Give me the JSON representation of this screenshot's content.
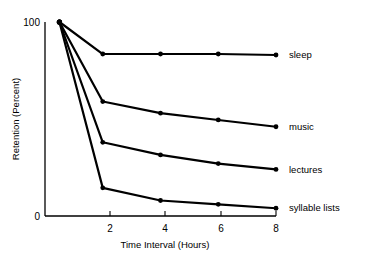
{
  "chart_data": {
    "type": "line",
    "title": "",
    "subtitle": "",
    "xlabel": "Time Interval (Hours)",
    "ylabel": "Retention (Percent)",
    "x": [
      0.5,
      2,
      4,
      6,
      8
    ],
    "xlim": [
      0,
      8
    ],
    "ylim": [
      0,
      100
    ],
    "xticks": [
      2,
      4,
      6,
      8
    ],
    "xtick_labels": [
      "2",
      "4",
      "6",
      "8"
    ],
    "yticks": [
      0,
      100
    ],
    "ytick_labels": [
      "0",
      "100"
    ],
    "grid": false,
    "legend_position": "right-inline-labels",
    "marker": "filled-circle",
    "line_color": "#000000",
    "series": [
      {
        "name": "sleep",
        "label": "sleep",
        "values": [
          100,
          83.5,
          83.5,
          83.5,
          83
        ]
      },
      {
        "name": "music",
        "label": "music",
        "values": [
          100,
          59,
          53,
          49.5,
          46
        ]
      },
      {
        "name": "lectures",
        "label": "lectures",
        "values": [
          100,
          38,
          31.5,
          27,
          24
        ]
      },
      {
        "name": "syllable lists",
        "label": "syllable lists",
        "values": [
          100,
          14.5,
          8,
          6,
          4
        ]
      }
    ]
  },
  "axes": {
    "y_top_label": "100",
    "y_bottom_label": "0",
    "x_labels": [
      "2",
      "4",
      "6",
      "8"
    ],
    "x_title": "Time Interval (Hours)",
    "y_title": "Retention (Percent)"
  },
  "series_labels": {
    "sleep": "sleep",
    "music": "music",
    "lectures": "lectures",
    "syllable_lists": "syllable lists"
  }
}
